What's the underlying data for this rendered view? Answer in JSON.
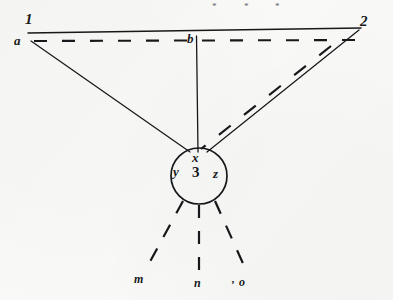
{
  "figure": {
    "kind": "hand-drawn-geometric-diagram",
    "canvas": {
      "width": 393,
      "height": 300
    },
    "ink_color": "#17181a",
    "paper_color": "#f9f9f7",
    "star_color": "#5d6066",
    "labels": {
      "endpoint_left_top": "1",
      "endpoint_right_top": "2",
      "point_a": "a",
      "point_b": "b",
      "core_top": "x",
      "core_left": "y",
      "core_center": "3",
      "core_right": "z",
      "ray_left_end": "m",
      "ray_center_end": "n",
      "ray_right_end": "o",
      "tick_mark": ","
    },
    "markers": {
      "asterisk": "*",
      "count": 3,
      "positions": [
        {
          "x": 215,
          "y": 5
        },
        {
          "x": 247,
          "y": 5
        },
        {
          "x": 278,
          "y": 5
        }
      ]
    },
    "label_positions": {
      "endpoint_left_top": {
        "x": 25,
        "y": 14
      },
      "endpoint_right_top": {
        "x": 360,
        "y": 16
      },
      "point_a": {
        "x": 15,
        "y": 35
      },
      "point_b": {
        "x": 188,
        "y": 33
      },
      "core_top": {
        "x": 193,
        "y": 150
      },
      "core_left": {
        "x": 174,
        "y": 165
      },
      "core_center": {
        "x": 193,
        "y": 164
      },
      "core_right": {
        "x": 214,
        "y": 166
      },
      "ray_left_end": {
        "x": 135,
        "y": 271
      },
      "ray_center_end": {
        "x": 194,
        "y": 276
      },
      "ray_right_end": {
        "x": 240,
        "y": 274
      },
      "tick_mark": {
        "x": 232,
        "y": 276
      }
    },
    "geometry": {
      "solid_baseline": {
        "x1": 28,
        "y1": 33,
        "x2": 361,
        "y2": 28
      },
      "dashed_baseline": {
        "x1": 34,
        "y1": 41,
        "x2": 356,
        "y2": 40
      },
      "vertical_line": {
        "x1": 196,
        "y1": 35,
        "x2": 198,
        "y2": 152
      },
      "left_chord": {
        "x1": 31,
        "y1": 41,
        "x2": 190,
        "y2": 152
      },
      "right_chord": {
        "x1": 359,
        "y1": 30,
        "x2": 207,
        "y2": 152
      },
      "right_dashed_parallel": {
        "x1": 330,
        "y1": 45,
        "x2": 200,
        "y2": 148
      },
      "circle": {
        "cx": 199,
        "cy": 176,
        "r": 28
      },
      "rays_from_circle": [
        {
          "name": "ray-to-m",
          "x1": 183,
          "y1": 200,
          "x2": 145,
          "y2": 269
        },
        {
          "name": "ray-to-n",
          "x1": 199,
          "y1": 204,
          "x2": 199,
          "y2": 272
        },
        {
          "name": "ray-to-o",
          "x1": 215,
          "y1": 200,
          "x2": 244,
          "y2": 268
        }
      ]
    }
  }
}
